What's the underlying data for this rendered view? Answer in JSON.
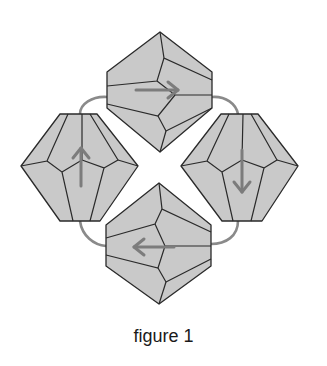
{
  "figure": {
    "caption": "figure 1",
    "beads": [
      {
        "id": "top",
        "arrow_direction": "right"
      },
      {
        "id": "right",
        "arrow_direction": "down"
      },
      {
        "id": "bottom",
        "arrow_direction": "left"
      },
      {
        "id": "left",
        "arrow_direction": "up"
      }
    ],
    "colors": {
      "bead_fill": "#c9c9c9",
      "bead_outline": "#2a2a2a",
      "thread": "#8a8a8a",
      "arrow": "#7c7c7c",
      "background": "#ffffff"
    }
  }
}
